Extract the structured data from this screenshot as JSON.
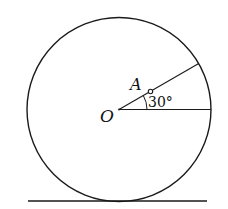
{
  "diagram": {
    "labels": {
      "center": "O",
      "point": "A",
      "angle": "30°"
    },
    "colors": {
      "stroke": "#1a1a1a",
      "background": "#ffffff"
    },
    "geometry": {
      "circle_center": [
        119,
        110
      ],
      "circle_radius": 92,
      "angle_degrees": 30,
      "ground_y": 201
    }
  }
}
